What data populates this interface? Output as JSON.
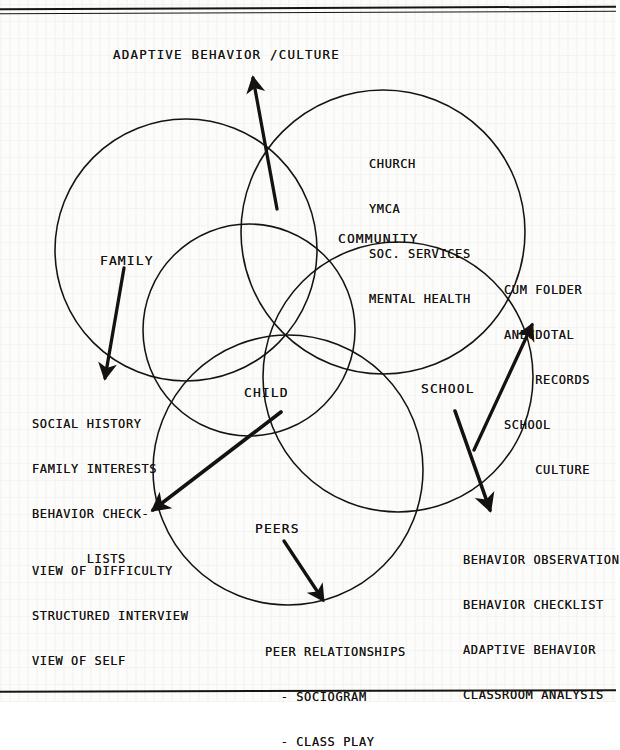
{
  "document": {
    "type": "scanned-figure",
    "title_text": "ADAPTIVE BEHAVIOR /CULTURE",
    "ink_color": "#141210",
    "paper_color": "#fcfcfa"
  },
  "rules": {
    "top_rule": "",
    "top_rule_2": "",
    "bottom_rule": ""
  },
  "diagram": {
    "circles": [
      {
        "name": "family-circle",
        "label": "FAMILY",
        "cx": 186,
        "cy": 250,
        "r": 131
      },
      {
        "name": "community-circle",
        "label": "COMMUNITY",
        "cx": 383,
        "cy": 232,
        "r": 142
      },
      {
        "name": "school-circle",
        "label": "SCHOOL",
        "cx": 398,
        "cy": 377,
        "r": 135
      },
      {
        "name": "peers-circle",
        "label": "PEERS",
        "cx": 288,
        "cy": 470,
        "r": 135
      },
      {
        "name": "child-circle",
        "label": "CHILD",
        "cx": 249,
        "cy": 330,
        "r": 106
      }
    ],
    "circle_labels": {
      "family": "FAMILY",
      "community": "COMMUNITY",
      "school": "SCHOOL",
      "peers": "PEERS",
      "child": "CHILD"
    },
    "annotations": {
      "adaptive_behavior_culture": "ADAPTIVE BEHAVIOR /CULTURE",
      "community_resources": [
        "CHURCH",
        "YMCA",
        "SOC. SERVICES",
        "MENTAL HEALTH"
      ],
      "school_records": [
        "CUM FOLDER",
        "ANECDOTAL",
        "    RECORDS",
        "SCHOOL",
        "    CULTURE"
      ],
      "family_measures": [
        "SOCIAL HISTORY",
        "FAMILY INTERESTS",
        "BEHAVIOR CHECK-",
        "       LISTS"
      ],
      "child_measures": [
        "VIEW OF DIFFICULTY",
        "STRUCTURED INTERVIEW",
        "VIEW OF SELF"
      ],
      "school_measures": [
        "BEHAVIOR OBSERVATION",
        "BEHAVIOR CHECKLIST",
        "ADAPTIVE BEHAVIOR",
        "CLASSROOM ANALYSIS"
      ],
      "peer_measures": [
        "PEER RELATIONSHIPS",
        "  - SOCIOGRAM",
        "  - CLASS PLAY"
      ]
    },
    "arrows": [
      {
        "name": "arrow-adaptive-behavior-culture",
        "from": [
          277,
          209
        ],
        "to": [
          252,
          74
        ],
        "points_to": "ADAPTIVE BEHAVIOR /CULTURE"
      },
      {
        "name": "arrow-family-measures",
        "from": [
          124,
          268
        ],
        "to": [
          104,
          380
        ],
        "points_to": "SOCIAL HISTORY"
      },
      {
        "name": "arrow-school-records",
        "from": [
          474,
          450
        ],
        "to": [
          531,
          322
        ],
        "points_to": "CUM FOLDER"
      },
      {
        "name": "arrow-child-measures",
        "from": [
          280,
          412
        ],
        "to": [
          150,
          512
        ],
        "points_to": "VIEW OF DIFFICULTY"
      },
      {
        "name": "arrow-school-measures",
        "from": [
          455,
          411
        ],
        "to": [
          491,
          512
        ],
        "points_to": "BEHAVIOR OBSERVATION"
      },
      {
        "name": "arrow-peer-measures",
        "from": [
          283,
          541
        ],
        "to": [
          324,
          603
        ],
        "points_to": "PEER RELATIONSHIPS"
      }
    ]
  }
}
